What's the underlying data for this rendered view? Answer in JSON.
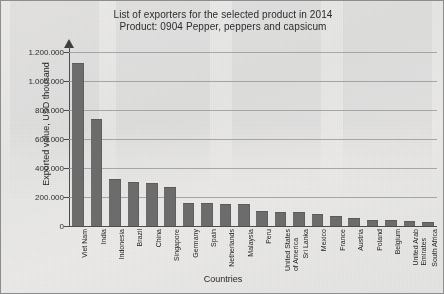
{
  "title": {
    "line1": "List of exporters for the selected product in 2014",
    "line2": "Product: 0904 Pepper, peppers and capsicum"
  },
  "axis": {
    "y_title": "Exported value, USD thousand",
    "x_title": "Countries"
  },
  "chart_data": {
    "type": "bar",
    "title": "List of exporters for the selected product in 2014",
    "subtitle": "Product: 0904 Pepper, peppers and capsicum",
    "xlabel": "Countries",
    "ylabel": "Exported value, USD thousand",
    "ylim": [
      0,
      1200000
    ],
    "grid": true,
    "legend": "none",
    "bar_color": "#6b6b6b",
    "ytick_labels": [
      "1.200.000",
      "1.000.000",
      "800.000",
      "600.000",
      "400.000",
      "200.000",
      "0"
    ],
    "ytick_values": [
      1200000,
      1000000,
      800000,
      600000,
      400000,
      200000,
      0
    ],
    "categories": [
      "Viet Nam",
      "India",
      "Indonesia",
      "Brazil",
      "China",
      "Singapore",
      "Germany",
      "Spain",
      "Netherlands",
      "Malaysia",
      "Peru",
      "United States\nof America",
      "Sri Lanka",
      "Mexico",
      "France",
      "Austria",
      "Poland",
      "Belgium",
      "United Arab\nEmirates",
      "South Africa"
    ],
    "values": [
      1120000,
      730000,
      320000,
      300000,
      290000,
      265000,
      155000,
      150000,
      148000,
      145000,
      95000,
      90000,
      88000,
      78000,
      62000,
      45000,
      38000,
      33000,
      28000,
      22000
    ]
  }
}
